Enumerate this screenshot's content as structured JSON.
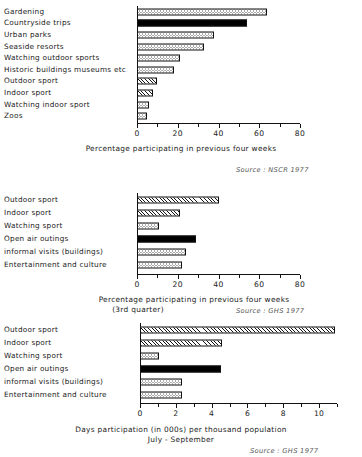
{
  "chart_data": [
    {
      "id": "chart-1",
      "type": "bar",
      "orientation": "horizontal",
      "title": "",
      "xlabel": "Percentage participating in previous four weeks",
      "ylabel": "",
      "xlim": [
        0,
        80
      ],
      "xticks": [
        0,
        20,
        40,
        60,
        80
      ],
      "xtick_labels": [
        "0",
        "20",
        "40",
        "60",
        "80"
      ],
      "minor_tick_step": 10,
      "grid": false,
      "source": "Source : NSCR 1977",
      "categories": [
        "Gardening",
        "Countryside trips",
        "Urban parks",
        "Seaside resorts",
        "Watching outdoor sports",
        "Historic buildings museums etc",
        "Outdoor sport",
        "Indoor sport",
        "Watching indoor sport",
        "Zoos"
      ],
      "values": [
        64,
        54,
        38,
        33,
        21,
        18,
        10,
        8,
        6,
        5
      ],
      "patterns": [
        "dot",
        "solid",
        "dot",
        "dot",
        "dot",
        "dot",
        "hatch",
        "hatch",
        "dot",
        "dot"
      ]
    },
    {
      "id": "chart-2",
      "type": "bar",
      "orientation": "horizontal",
      "title": "",
      "xlabel": "Percentage participating in previous four weeks",
      "xlabel_line2": "(3rd quarter)",
      "ylabel": "",
      "xlim": [
        0,
        80
      ],
      "xticks": [
        0,
        20,
        40,
        60,
        80
      ],
      "xtick_labels": [
        "0",
        "20",
        "40",
        "60",
        "80"
      ],
      "minor_tick_step": 10,
      "grid": false,
      "source": "Source : GHS 1977",
      "categories": [
        "Outdoor sport",
        "Indoor sport",
        "Watching sport",
        "Open air outings",
        "informal visits (buildings)",
        "Entertainment and culture"
      ],
      "values": [
        40,
        21,
        11,
        29,
        24,
        22
      ],
      "patterns": [
        "hatch",
        "hatch",
        "dot",
        "solid",
        "dot",
        "dot"
      ]
    },
    {
      "id": "chart-3",
      "type": "bar",
      "orientation": "horizontal",
      "title": "",
      "xlabel": "Days participation (in 000s) per thousand population",
      "xlabel_line2": "July - September",
      "ylabel": "",
      "xlim": [
        0,
        11
      ],
      "xticks": [
        0,
        2,
        4,
        6,
        8,
        10
      ],
      "xtick_labels": [
        "0",
        "2",
        "4",
        "6",
        "8",
        "10"
      ],
      "minor_tick_step": 1,
      "grid": false,
      "source": "Source :  GHS 1977",
      "categories": [
        "Outdoor sport",
        "Indoor sport",
        "Watching sport",
        "Open air outings",
        "informal visits (buildings)",
        "Entertainment and culture"
      ],
      "values": [
        10.9,
        4.6,
        1.05,
        4.55,
        2.35,
        2.35
      ],
      "patterns": [
        "hatch",
        "hatch",
        "dot",
        "solid",
        "dot",
        "dot"
      ]
    }
  ]
}
